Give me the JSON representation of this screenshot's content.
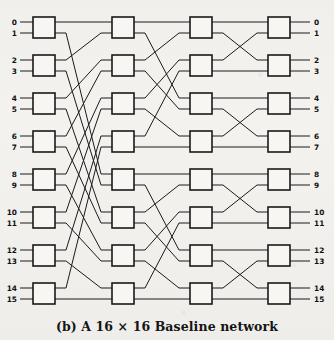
{
  "figure": {
    "caption_prefix": "(b)",
    "caption_text": "A 16 × 16 Baseline network",
    "caption_full": "(b) A 16 × 16 Baseline network",
    "network_name": "Baseline network",
    "size_label": "16 × 16",
    "stages": 4,
    "switches_per_stage": 8,
    "switch_size": "2 × 2",
    "total_inputs": 16,
    "total_outputs": 16,
    "background_color": "#f3f2ef",
    "line_color": "#1a1a1a",
    "box_fill": "#f7f6f3"
  },
  "input_labels": [
    "0",
    "1",
    "2",
    "3",
    "4",
    "5",
    "6",
    "7",
    "8",
    "9",
    "10",
    "11",
    "12",
    "13",
    "14",
    "15"
  ],
  "output_labels": [
    "0",
    "1",
    "2",
    "3",
    "4",
    "5",
    "6",
    "7",
    "8",
    "9",
    "10",
    "11",
    "12",
    "13",
    "14",
    "15"
  ],
  "chart_data": {
    "type": "diagram",
    "title": "(b) A 16 × 16 Baseline network",
    "stage_x": [
      33,
      112,
      190,
      268
    ],
    "box_width": 22,
    "box_height": 21,
    "box_y": [
      17,
      55,
      93,
      131,
      169,
      207,
      245,
      283
    ],
    "port_offsets": [
      5,
      16
    ],
    "input_stub_x": 20,
    "output_stub_x": 310,
    "links": {
      "stage1_to_stage2": [
        [
          0,
          0
        ],
        [
          1,
          8
        ],
        [
          2,
          1
        ],
        [
          3,
          9
        ],
        [
          4,
          2
        ],
        [
          5,
          10
        ],
        [
          6,
          3
        ],
        [
          7,
          11
        ],
        [
          8,
          4
        ],
        [
          9,
          12
        ],
        [
          10,
          5
        ],
        [
          11,
          13
        ],
        [
          12,
          6
        ],
        [
          13,
          14
        ],
        [
          14,
          7
        ],
        [
          15,
          15
        ]
      ],
      "stage2_to_stage3": [
        [
          0,
          0
        ],
        [
          1,
          4
        ],
        [
          2,
          1
        ],
        [
          3,
          5
        ],
        [
          4,
          2
        ],
        [
          5,
          6
        ],
        [
          6,
          3
        ],
        [
          7,
          7
        ],
        [
          8,
          8
        ],
        [
          9,
          12
        ],
        [
          10,
          9
        ],
        [
          11,
          13
        ],
        [
          12,
          10
        ],
        [
          13,
          14
        ],
        [
          14,
          11
        ],
        [
          15,
          15
        ]
      ],
      "stage3_to_stage4": [
        [
          0,
          0
        ],
        [
          1,
          2
        ],
        [
          2,
          1
        ],
        [
          3,
          3
        ],
        [
          4,
          4
        ],
        [
          5,
          6
        ],
        [
          6,
          5
        ],
        [
          7,
          7
        ],
        [
          8,
          8
        ],
        [
          9,
          10
        ],
        [
          10,
          9
        ],
        [
          11,
          11
        ],
        [
          12,
          12
        ],
        [
          13,
          14
        ],
        [
          14,
          13
        ],
        [
          15,
          15
        ]
      ]
    }
  }
}
